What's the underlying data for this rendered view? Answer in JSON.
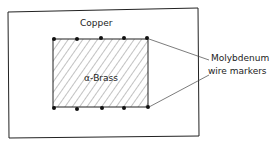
{
  "diagram": {
    "outer_label": "Copper",
    "inner_label": "α-Brass",
    "marker_label_line1": "Molybdenum",
    "marker_label_line2": "wire markers",
    "colors": {
      "line": "#222222",
      "hatch": "#555555",
      "background": "#ffffff"
    },
    "top_markers": 5,
    "bottom_markers": 5
  }
}
